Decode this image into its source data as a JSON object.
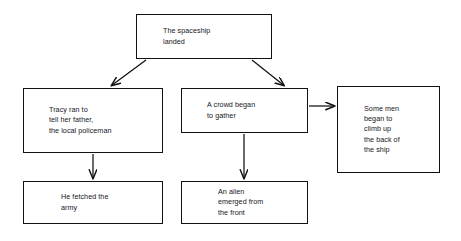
{
  "diagram": {
    "background_color": "#ffffff",
    "line_color": "#111111",
    "text_color": "#15151c",
    "nodes": [
      {
        "id": "spaceship",
        "name": "node-spaceship",
        "text": "The spaceship\nlanded"
      },
      {
        "id": "tracy",
        "name": "node-tracy",
        "text": "Tracy ran to\ntell her father,\nthe local policeman"
      },
      {
        "id": "crowd",
        "name": "node-crowd",
        "text": "A crowd began\nto gather"
      },
      {
        "id": "somemen",
        "name": "node-somemen",
        "text": "Some men\nbegan to\nclimb up\nthe back of\nthe ship"
      },
      {
        "id": "army",
        "name": "node-army",
        "text": "He fetched the\narmy"
      },
      {
        "id": "alien",
        "name": "node-alien",
        "text": "An alien\nemerged from\nthe front"
      }
    ],
    "connectors": [
      {
        "name": "arrow-spaceship-to-tracy",
        "from": "spaceship",
        "to": "tracy",
        "style": "diagonal-down-left"
      },
      {
        "name": "arrow-spaceship-to-crowd",
        "from": "spaceship",
        "to": "crowd",
        "style": "diagonal-down-right"
      },
      {
        "name": "arrow-crowd-to-somemen",
        "from": "crowd",
        "to": "somemen",
        "style": "horizontal-right"
      },
      {
        "name": "arrow-tracy-to-army",
        "from": "tracy",
        "to": "army",
        "style": "vertical-down"
      },
      {
        "name": "arrow-crowd-to-alien",
        "from": "crowd",
        "to": "alien",
        "style": "vertical-down"
      }
    ]
  }
}
